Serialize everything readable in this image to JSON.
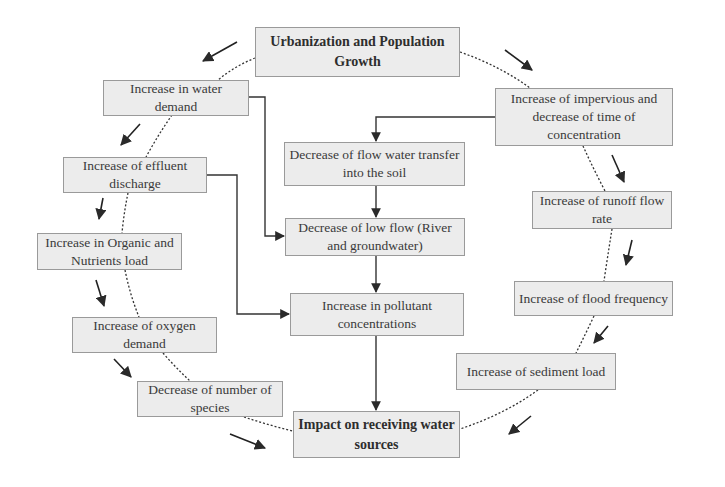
{
  "colors": {
    "box_fill": "#ececec",
    "box_border": "#9a9a9a",
    "line": "#333333",
    "text": "#3a3a3a"
  },
  "nodes": {
    "urbanization": "Urbanization and Population Growth",
    "water_demand": "Increase in water demand",
    "effluent": "Increase of effluent discharge",
    "organic": "Increase in Organic and Nutrients load",
    "oxygen": "Increase of oxygen demand",
    "species": "Decrease of number of species",
    "impact": "Impact on receiving water sources",
    "impervious": "Increase of impervious and decrease of time of concentration",
    "flow_transfer": "Decrease of flow water transfer into the soil",
    "low_flow": "Decrease of low flow (River and groundwater)",
    "pollutant": "Increase in pollutant concentrations",
    "runoff": "Increase of runoff flow rate",
    "flood": "Increase of flood frequency",
    "sediment": "Increase of sediment load"
  },
  "edges": [
    {
      "from": "impervious",
      "to": "flow_transfer",
      "style": "solid"
    },
    {
      "from": "flow_transfer",
      "to": "low_flow",
      "style": "solid"
    },
    {
      "from": "low_flow",
      "to": "pollutant",
      "style": "solid"
    },
    {
      "from": "pollutant",
      "to": "impact",
      "style": "solid"
    },
    {
      "from": "water_demand",
      "to": "low_flow",
      "style": "solid"
    },
    {
      "from": "effluent",
      "to": "pollutant",
      "style": "solid"
    },
    {
      "from": "urbanization",
      "to": "water_demand",
      "style": "dotted-cycle"
    },
    {
      "from": "water_demand",
      "to": "effluent",
      "style": "dotted-cycle"
    },
    {
      "from": "effluent",
      "to": "organic",
      "style": "dotted-cycle"
    },
    {
      "from": "organic",
      "to": "oxygen",
      "style": "dotted-cycle"
    },
    {
      "from": "oxygen",
      "to": "species",
      "style": "dotted-cycle"
    },
    {
      "from": "species",
      "to": "impact",
      "style": "dotted-cycle"
    },
    {
      "from": "urbanization",
      "to": "impervious",
      "style": "dotted-cycle"
    },
    {
      "from": "impervious",
      "to": "runoff",
      "style": "dotted-cycle"
    },
    {
      "from": "runoff",
      "to": "flood",
      "style": "dotted-cycle"
    },
    {
      "from": "flood",
      "to": "sediment",
      "style": "dotted-cycle"
    },
    {
      "from": "sediment",
      "to": "impact",
      "style": "dotted-cycle"
    }
  ]
}
